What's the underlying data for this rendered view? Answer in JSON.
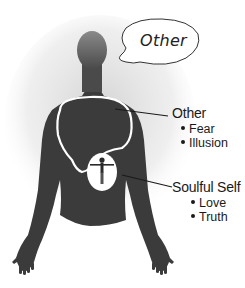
{
  "speech_bubble": {
    "text": "Other"
  },
  "callouts": [
    {
      "title": "Other",
      "items": [
        "Fear",
        "Illusion"
      ]
    },
    {
      "title": "Soulful Self",
      "items": [
        "Love",
        "Truth"
      ]
    }
  ],
  "colors": {
    "silhouette": "#3a3a3a",
    "head": "#6e6e6e",
    "outline": "#ffffff",
    "haze": "#d8d8d8"
  }
}
